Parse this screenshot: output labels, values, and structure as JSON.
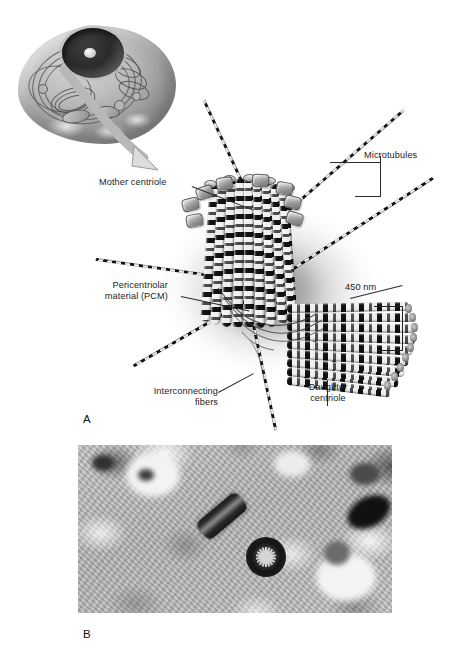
{
  "figure": {
    "domain": "scientific-figure",
    "background_color": "#ffffff",
    "text_color": "#1d1d1d"
  },
  "panels": [
    {
      "letter": "A",
      "type": "illustration",
      "caption_letter": "A"
    },
    {
      "letter": "B",
      "type": "electron-micrograph",
      "caption_letter": "B"
    }
  ],
  "panel_a": {
    "letter": "A",
    "inset": {
      "name": "eukaryotic-cell-cutaway",
      "description": "Cutaway drawing of a eukaryotic cell with nucleus, endoplasmic reticulum and Golgi apparatus",
      "arrow": "curved-arrow-to-centrosome"
    },
    "labels": {
      "mother_centriole": "Mother centriole",
      "pericentriolar_material_line1": "Pericentriolar",
      "pericentriolar_material_line2": "material (PCM)",
      "interconnecting_line1": "Interconnecting",
      "interconnecting_line2": "fibers",
      "microtubules": "Microtubules",
      "dimension": "450 nm",
      "daughter_line1": "Daughter",
      "daughter_line2": "centriole"
    },
    "structures": {
      "mother_centriole": "nine triplet microtubule barrel, vertical, with distal appendages",
      "daughter_centriole": "nine triplet microtubule barrel, horizontal, orthogonal to mother",
      "pcm": "diffuse grey cloud surrounding both centrioles",
      "astral_microtubules_count": 7,
      "mother_triplet_count": 9,
      "daughter_triplet_count": 9,
      "appendage_count": 8
    },
    "measurement": {
      "value": "450",
      "unit": "nm",
      "applies_to": "daughter centriole length"
    }
  },
  "panel_b": {
    "letter": "B",
    "description": "Transmission electron micrograph of a centrosome",
    "features": [
      "centriole in longitudinal section",
      "centriole in cross section showing nine-fold cartwheel",
      "dark electron-dense vesicle at right",
      "surrounding cytoplasm with membranes"
    ]
  }
}
